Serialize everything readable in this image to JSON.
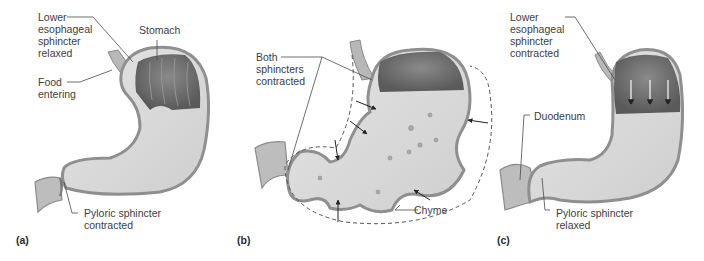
{
  "figure": {
    "panels": [
      {
        "id": "a",
        "letter": "(a)",
        "labels": {
          "les": "Lower\nesophageal\nsphincter\nrelaxed",
          "stomach": "Stomach",
          "food": "Food\nentering",
          "pyloric": "Pyloric sphincter\ncontracted"
        }
      },
      {
        "id": "b",
        "letter": "(b)",
        "labels": {
          "both": "Both\nsphincters\ncontracted",
          "chyme": "Chyme"
        }
      },
      {
        "id": "c",
        "letter": "(c)",
        "labels": {
          "les": "Lower\nesophageal\nsphincter\ncontracted",
          "duodenum": "Duodenum",
          "pyloric": "Pyloric sphincter\nrelaxed"
        }
      }
    ],
    "colors": {
      "wall_outer": "#9a9a9a",
      "wall_inner": "#c8c8c8",
      "lumen": "#d9d9d9",
      "fundus_dark": "#6e6e6e",
      "leader_line": "#4a4a4a",
      "arrow": "#222222"
    }
  }
}
